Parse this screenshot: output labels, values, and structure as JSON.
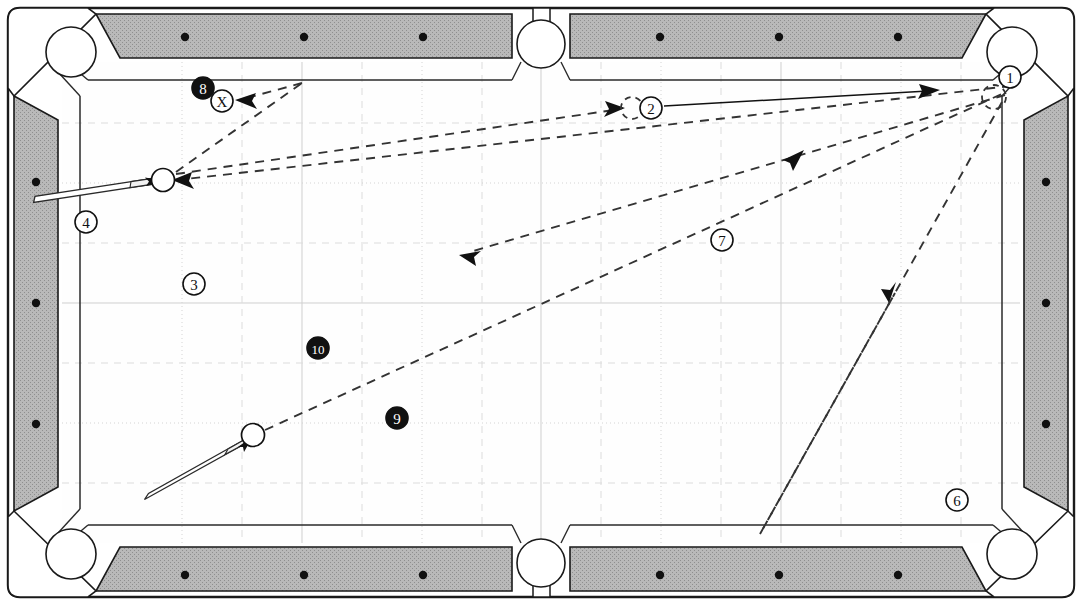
{
  "diagram": {
    "kind": "billiard-table-shot-diagram",
    "table": {
      "rail_color": "#b4b4b4",
      "rail_edge_color": "#1a1a1a",
      "cloth_color": "#ffffff",
      "grid_color": "#cccccc",
      "pocket_color": "#ffffff",
      "outer_frame_color": "#1a1a1a",
      "playfield": {
        "x": 62,
        "y": 62,
        "width": 958,
        "height": 481
      },
      "rail_spot_count_long": 6,
      "rail_spot_count_short": 3
    },
    "pockets": [
      {
        "name": "top-left-pocket",
        "cx": 71,
        "cy": 52,
        "r": 25
      },
      {
        "name": "top-center-pocket",
        "cx": 541,
        "cy": 43,
        "r": 24
      },
      {
        "name": "top-right-pocket",
        "cx": 1013,
        "cy": 52,
        "r": 25
      },
      {
        "name": "bottom-left-pocket",
        "cx": 71,
        "cy": 555,
        "r": 25
      },
      {
        "name": "bottom-center-pocket",
        "cx": 541,
        "cy": 564,
        "r": 24
      },
      {
        "name": "bottom-right-pocket",
        "cx": 1013,
        "cy": 555,
        "r": 25
      }
    ],
    "balls": [
      {
        "name": "cue-ball-upper",
        "cx": 163,
        "cy": 179,
        "r": 11,
        "style": "solid-outline"
      },
      {
        "name": "cue-ball-lower",
        "cx": 253,
        "cy": 435,
        "r": 11,
        "style": "solid-outline"
      },
      {
        "name": "ghost-ball-near-two",
        "cx": 632,
        "cy": 108,
        "r": 11,
        "style": "dashed-outline"
      },
      {
        "name": "ghost-ball-near-one",
        "cx": 995,
        "cy": 96,
        "r": 11,
        "style": "dashed-outline"
      }
    ],
    "cues": [
      {
        "name": "cue-stick-upper",
        "tip_x": 152,
        "tip_y": 182,
        "butt_x": 34,
        "butt_y": 200
      },
      {
        "name": "cue-stick-lower",
        "tip_x": 245,
        "tip_y": 442,
        "butt_x": 146,
        "butt_y": 497
      }
    ],
    "labels": [
      {
        "id": "label-8",
        "text": "8",
        "cx": 203,
        "cy": 88,
        "r": 11,
        "filled": true
      },
      {
        "id": "label-x",
        "text": "X",
        "cx": 221,
        "cy": 101,
        "r": 11,
        "filled": false
      },
      {
        "id": "label-4",
        "text": "4",
        "cx": 86,
        "cy": 222,
        "r": 11,
        "filled": false
      },
      {
        "id": "label-3",
        "text": "3",
        "cx": 194,
        "cy": 284,
        "r": 11,
        "filled": false
      },
      {
        "id": "label-10",
        "text": "10",
        "cx": 318,
        "cy": 348,
        "r": 11,
        "filled": true
      },
      {
        "id": "label-9",
        "text": "9",
        "cx": 397,
        "cy": 418,
        "r": 11,
        "filled": true
      },
      {
        "id": "label-2",
        "text": "2",
        "cx": 650,
        "cy": 108,
        "r": 11,
        "filled": false
      },
      {
        "id": "label-1",
        "text": "1",
        "cx": 1010,
        "cy": 77,
        "r": 11,
        "filled": false
      },
      {
        "id": "label-7",
        "text": "7",
        "cx": 722,
        "cy": 240,
        "r": 11,
        "filled": false
      },
      {
        "id": "label-6",
        "text": "6",
        "cx": 957,
        "cy": 500,
        "r": 11,
        "filled": false
      }
    ],
    "paths": [
      {
        "name": "path-two-to-corner-solid",
        "style": "solid",
        "points": "663,106 935,91",
        "arrow_at": "935,91",
        "arrow_angle": -3
      },
      {
        "name": "path-cue-upper-to-two-dashed",
        "style": "dashed",
        "points": "175,176 620,110",
        "arrow_at": "620,110",
        "arrow_angle": -8
      },
      {
        "name": "path-cue-upper-rebound-to-x-dashed",
        "style": "dashed",
        "points": "175,176 300,83 241,99",
        "arrow_at": "241,99",
        "arrow_angle": 195
      },
      {
        "name": "path-upper-long-reflect-dashed",
        "style": "dashed",
        "points": "1012,86 172,180",
        "arrow_at": "172,180",
        "arrow_angle": 186
      },
      {
        "name": "path-diagonal-down-left-dashed",
        "style": "dashed",
        "points": "1008,92 463,253",
        "arrow_at": "463,253",
        "arrow_angle": 164
      },
      {
        "name": "path-cue-lower-to-corner-dashed",
        "style": "dashed",
        "points": "264,431 1008,91",
        "arrow_at": "799,153",
        "arrow_angle": -24
      },
      {
        "name": "path-corner-bounce-v-dashed",
        "style": "dashed",
        "points": "1004,100 760,534 890,300",
        "arrow_at": "890,300",
        "arrow_angle": 299
      }
    ]
  }
}
